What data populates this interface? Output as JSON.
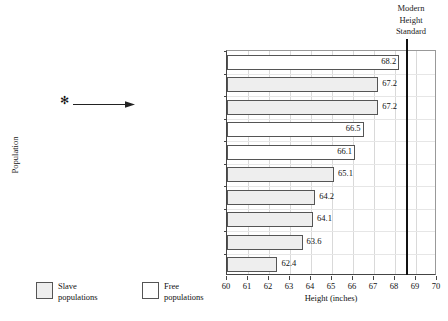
{
  "chart_data": {
    "type": "bar",
    "orientation": "horizontal",
    "title": "",
    "xlabel": "Height (inches)",
    "ylabel": "Population",
    "xlim": [
      60,
      70
    ],
    "xticks": [
      60,
      61,
      62,
      63,
      64,
      65,
      66,
      67,
      68,
      69,
      70
    ],
    "grid": true,
    "legend_position": "bottom-left",
    "categories": [
      "U.S.-born northern whites, 1863–65",
      "Slaves in British nonsugar colonies, 1819–25",
      "U.S. slaves, 1811–60",
      "British urban artisans, 1883",
      "British Royal Marines, 1827–29",
      "Trinidad-born slaves, 1813",
      "Africans imported into U.S.",
      "Guyana-born slaves, 1819",
      "Cuban-born slaves, 1855–59",
      "African slaves in Cuba, 1855–59"
    ],
    "values": [
      68.2,
      67.2,
      67.2,
      66.5,
      66.1,
      65.1,
      64.2,
      64.1,
      63.6,
      62.4
    ],
    "value_labels": [
      "68.2",
      "67.2",
      "67.2",
      "66.5",
      "66.1",
      "65.1",
      "64.2",
      "64.1",
      "63.6",
      "62.4"
    ],
    "groups": [
      "free",
      "slave",
      "slave",
      "free",
      "free",
      "slave",
      "slave",
      "slave",
      "slave",
      "slave"
    ],
    "annotations": [
      {
        "type": "reference-line",
        "label": "Modern Height Standard",
        "value": 68.5
      },
      {
        "type": "pointer",
        "symbol": "✻",
        "target": "U.S. slaves, 1811–60"
      }
    ]
  },
  "modern_standard": {
    "line1": "Modern",
    "line2": "Height",
    "line3": "Standard"
  },
  "axes": {
    "y_title": "Population",
    "x_title": "Height (inches)"
  },
  "legend": {
    "items": [
      {
        "group": "slave",
        "line1": "Slave",
        "line2": "populations"
      },
      {
        "group": "free",
        "line1": "Free",
        "line2": "populations"
      }
    ]
  },
  "annotation": {
    "asterisk": "✻"
  },
  "colors": {
    "slave_fill": "#eeeeee",
    "free_fill": "#ffffff",
    "bar_stroke": "#555555",
    "axis": "#444444",
    "grid": "#d9d9d9",
    "reference_line": "#111111",
    "text": "#111111"
  },
  "source_note": ""
}
